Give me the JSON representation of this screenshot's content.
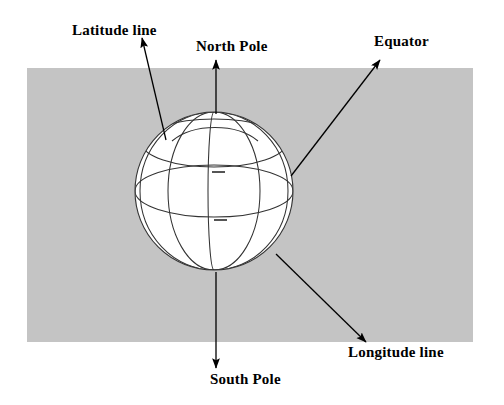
{
  "figure": {
    "type": "labeled-diagram",
    "background_color": "#ffffff",
    "panel_color": "#c4c4c4",
    "globe_fill": "#ffffff",
    "line_color": "#000000"
  },
  "panel": {
    "x": 27,
    "y": 68,
    "width": 446,
    "height": 274
  },
  "globe": {
    "center_x": 214,
    "center_y": 191,
    "radius": 79,
    "tick_marks": [
      {
        "x": 218,
        "y": 172,
        "width": 13
      },
      {
        "x": 220,
        "y": 220,
        "width": 13
      }
    ]
  },
  "labels": {
    "latitude_line": "Latitude line",
    "north_pole": "North Pole",
    "equator": "Equator",
    "longitude_line": "Longitude line",
    "south_pole": "South Pole"
  },
  "arrows": [
    {
      "name": "latitude-line-arrow",
      "label": "Latitude line",
      "from_x": 166,
      "from_y": 140,
      "to_x": 142,
      "to_y": 38
    },
    {
      "name": "north-pole-arrow",
      "label": "North Pole",
      "from_x": 216,
      "from_y": 114,
      "to_x": 216,
      "to_y": 60
    },
    {
      "name": "equator-arrow",
      "label": "Equator",
      "from_x": 291,
      "from_y": 176,
      "to_x": 380,
      "to_y": 60
    },
    {
      "name": "longitude-line-arrow",
      "label": "Longitude line",
      "from_x": 276,
      "from_y": 254,
      "to_x": 366,
      "to_y": 342
    },
    {
      "name": "south-pole-arrow",
      "label": "South Pole",
      "from_x": 216,
      "from_y": 272,
      "to_x": 216,
      "to_y": 368
    }
  ]
}
